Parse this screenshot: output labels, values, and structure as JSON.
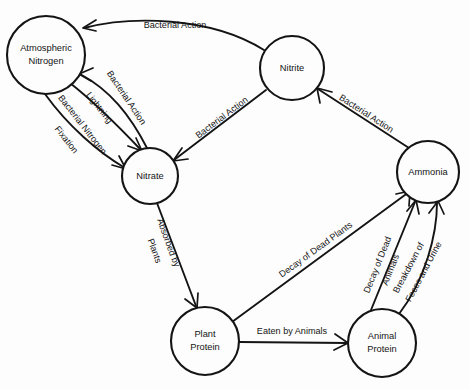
{
  "diagram": {
    "background_color": "#fdfdfd",
    "stroke_color": "#141414",
    "nodes": [
      {
        "id": "atmospheric-nitrogen",
        "line1": "Atmospheric",
        "line2": "Nitrogen",
        "cx": 46,
        "cy": 55,
        "r": 39
      },
      {
        "id": "nitrite",
        "line1": "Nitrite",
        "line2": "",
        "cx": 292,
        "cy": 68,
        "r": 32
      },
      {
        "id": "nitrate",
        "line1": "Nitrate",
        "line2": "",
        "cx": 150,
        "cy": 176,
        "r": 28
      },
      {
        "id": "ammonia",
        "line1": "Ammonia",
        "line2": "",
        "cx": 428,
        "cy": 172,
        "r": 31
      },
      {
        "id": "plant-protein",
        "line1": "Plant",
        "line2": "Protein",
        "cx": 205,
        "cy": 341,
        "r": 34
      },
      {
        "id": "animal-protein",
        "line1": "Animal",
        "line2": "Protein",
        "cx": 382,
        "cy": 343,
        "r": 34
      }
    ],
    "edges": [
      {
        "id": "nitrite-to-atmospheric-nitrogen",
        "label": "Bacterial Action",
        "from": "nitrite",
        "to": "atmospheric-nitrogen"
      },
      {
        "id": "nitrate-to-atmospheric-nitrogen",
        "label": "Bacterial Action",
        "from": "nitrate",
        "to": "atmospheric-nitrogen"
      },
      {
        "id": "atmospheric-nitrogen-to-nitrate-lightning",
        "label": "Lightning",
        "from": "atmospheric-nitrogen",
        "to": "nitrate"
      },
      {
        "id": "atmospheric-nitrogen-to-nitrate-fixation",
        "label": "Bacterial Nitrogen Fixation",
        "label_line1": "Bacterial Nitrogen",
        "label_line2": "Fixation",
        "from": "atmospheric-nitrogen",
        "to": "nitrate"
      },
      {
        "id": "nitrite-to-nitrate",
        "label": "Bacterial Action",
        "from": "nitrite",
        "to": "nitrate"
      },
      {
        "id": "ammonia-to-nitrite",
        "label": "Bacterial Action",
        "from": "ammonia",
        "to": "nitrite"
      },
      {
        "id": "nitrate-to-plant-protein",
        "label": "Absorbed by Plants",
        "label_line1": "Absorbed by",
        "label_line2": "Plants",
        "from": "nitrate",
        "to": "plant-protein"
      },
      {
        "id": "plant-protein-to-ammonia",
        "label": "Decay of Dead Plants",
        "from": "plant-protein",
        "to": "ammonia"
      },
      {
        "id": "plant-protein-to-animal-protein",
        "label": "Eaten by Animals",
        "from": "plant-protein",
        "to": "animal-protein"
      },
      {
        "id": "animal-protein-to-ammonia-decay",
        "label": "Decay of Dead Animals",
        "label_line1": "Decay of Dead",
        "label_line2": "Animals",
        "from": "animal-protein",
        "to": "ammonia"
      },
      {
        "id": "animal-protein-to-ammonia-breakdown",
        "label": "Breakdown of Feces and Urine",
        "label_line1": "Breakdown of",
        "label_line2": "Feces and Urine",
        "from": "animal-protein",
        "to": "ammonia"
      }
    ]
  }
}
